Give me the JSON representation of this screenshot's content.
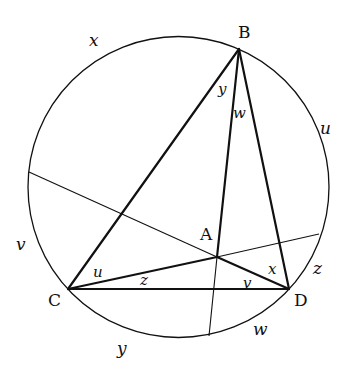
{
  "diagram": {
    "type": "geometry",
    "colors": {
      "stroke": "#111111",
      "background": "#ffffff"
    },
    "circle": {
      "cx": 178.5,
      "cy": 187,
      "r": 150.5
    },
    "points": {
      "B": {
        "label": "B",
        "x": 239,
        "y": 49,
        "label_x": 238,
        "label_y": 38
      },
      "C": {
        "label": "C",
        "x": 68,
        "y": 289,
        "label_x": 48,
        "label_y": 306
      },
      "D": {
        "label": "D",
        "x": 289,
        "y": 289,
        "label_x": 294,
        "label_y": 306
      },
      "A": {
        "label": "A",
        "x": 217,
        "y": 257,
        "label_x": 200,
        "label_y": 240
      }
    },
    "arc_labels": [
      {
        "text": "x",
        "x": 89,
        "y": 46
      },
      {
        "text": "u",
        "x": 320,
        "y": 134
      },
      {
        "text": "v",
        "x": 16,
        "y": 250
      },
      {
        "text": "z",
        "x": 313,
        "y": 274
      },
      {
        "text": "w",
        "x": 253,
        "y": 335
      },
      {
        "text": "y",
        "x": 117,
        "y": 354
      }
    ],
    "angle_labels": [
      {
        "text": "y",
        "x": 218,
        "y": 94
      },
      {
        "text": "w",
        "x": 233,
        "y": 118
      },
      {
        "text": "u",
        "x": 93,
        "y": 277
      },
      {
        "text": "z",
        "x": 140,
        "y": 285
      },
      {
        "text": "v",
        "x": 243,
        "y": 288
      },
      {
        "text": "x",
        "x": 268,
        "y": 274
      }
    ],
    "thin_chords": [
      {
        "name": "chord-left-to-A",
        "x1": 29,
        "y1": 172,
        "x2": 217,
        "y2": 257
      },
      {
        "name": "chord-A-to-right",
        "x1": 217,
        "y1": 257,
        "x2": 319,
        "y2": 234
      },
      {
        "name": "chord-A-to-bottom",
        "x1": 217,
        "y1": 257,
        "x2": 209,
        "y2": 336
      }
    ],
    "thick_segments": [
      {
        "name": "segment-BC",
        "from": "B",
        "to": "C"
      },
      {
        "name": "segment-BD",
        "from": "B",
        "to": "D"
      },
      {
        "name": "segment-CD",
        "from": "C",
        "to": "D"
      },
      {
        "name": "segment-BA",
        "from": "B",
        "to": "A"
      },
      {
        "name": "segment-CA",
        "from": "C",
        "to": "A"
      },
      {
        "name": "segment-AD",
        "from": "A",
        "to": "D"
      }
    ]
  }
}
